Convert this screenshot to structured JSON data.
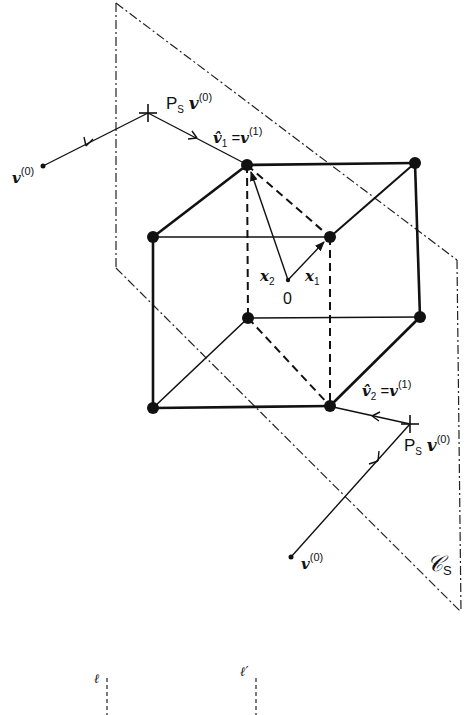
{
  "diagram": {
    "type": "geometric projection figure",
    "plane_label": "𝒞",
    "plane_label_sub": "S",
    "origin_label": "0",
    "vectors": {
      "x1": {
        "base": "x",
        "sub": "1"
      },
      "x2": {
        "base": "x",
        "sub": "2"
      }
    },
    "top_path": {
      "start": {
        "base": "v",
        "sup": "(0)"
      },
      "projection": {
        "prefix": "P",
        "prefix_sub": "S",
        "base": "v",
        "sup": "(0)"
      },
      "result": {
        "hat": "v̂",
        "sub": "1",
        "eq": "=",
        "base": "v",
        "sup": "(1)"
      }
    },
    "bottom_path": {
      "start": {
        "base": "v",
        "sup": "(0)"
      },
      "projection": {
        "prefix": "P",
        "prefix_sub": "S",
        "base": "v",
        "sup": "(0)"
      },
      "result": {
        "hat": "v̂",
        "sub": "2",
        "eq": "=",
        "base": "v",
        "sup": "(1)"
      }
    },
    "bottom_lines": {
      "left": "ℓ",
      "right": "ℓ′"
    },
    "colors": {
      "ink": "#111111",
      "background": "#ffffff"
    }
  }
}
